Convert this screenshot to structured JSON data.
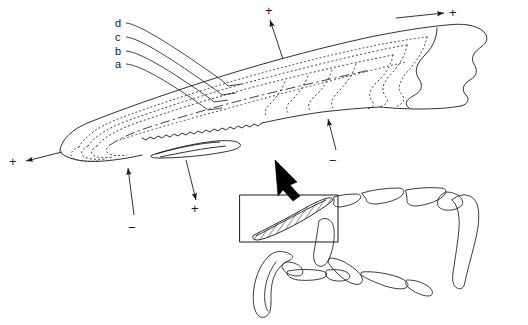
{
  "figure": {
    "background_color": "#ffffff",
    "line_color": "#1a1a1a",
    "width": 528,
    "height": 325
  },
  "layer_labels": [
    {
      "id": "layer-d",
      "text": "d",
      "x": 115,
      "y": 20
    },
    {
      "id": "layer-c",
      "text": "c",
      "x": 115,
      "y": 34
    },
    {
      "id": "layer-b",
      "text": "b",
      "x": 115,
      "y": 48
    },
    {
      "id": "layer-a",
      "text": "a",
      "x": 115,
      "y": 61
    }
  ],
  "sign_annotations": [
    {
      "id": "sign-top-middle",
      "text": "+",
      "x": 265,
      "y": 5,
      "arrow": "up"
    },
    {
      "id": "sign-top-right",
      "text": "+",
      "x": 449,
      "y": 8,
      "arrow": "right"
    },
    {
      "id": "sign-left",
      "text": "+",
      "x": 10,
      "y": 156,
      "arrow": "left"
    },
    {
      "id": "sign-right-lower",
      "text": "−",
      "x": 329,
      "y": 155,
      "arrow": "up"
    },
    {
      "id": "sign-bottom-left",
      "text": "−",
      "x": 129,
      "y": 222,
      "arrow": "up"
    },
    {
      "id": "sign-bottom-middle",
      "text": "+",
      "x": 191,
      "y": 203,
      "arrow": "down"
    }
  ],
  "inset": {
    "name": "limb-skeleton-inset",
    "highlight_box": {
      "x": 240,
      "y": 195,
      "width": 98,
      "height": 47
    },
    "hatched_element": "hatched-claw-sheath",
    "pointer_arrow": "thick-black-arrow-up-left"
  }
}
